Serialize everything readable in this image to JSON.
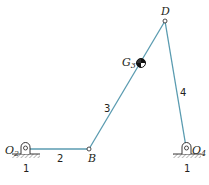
{
  "diagram": {
    "link_color": "#5a9bb0",
    "points": {
      "O2": {
        "label_main": "O",
        "label_sub": "2",
        "x": 25,
        "y": 149
      },
      "B": {
        "label": "B",
        "x": 89,
        "y": 149
      },
      "D": {
        "label": "D",
        "x": 165,
        "y": 21
      },
      "G3": {
        "label_main": "G",
        "label_sub": "3",
        "x": 141,
        "y": 63
      },
      "O4": {
        "label_main": "O",
        "label_sub": "4",
        "x": 186,
        "y": 147
      }
    },
    "links": [
      {
        "id": "2",
        "label": "2",
        "from": "O2",
        "to": "B"
      },
      {
        "id": "3",
        "label": "3",
        "from": "B",
        "to": "D"
      },
      {
        "id": "4",
        "label": "4",
        "from": "D",
        "to": "O4"
      }
    ],
    "ground_labels": [
      "1",
      "1"
    ]
  }
}
